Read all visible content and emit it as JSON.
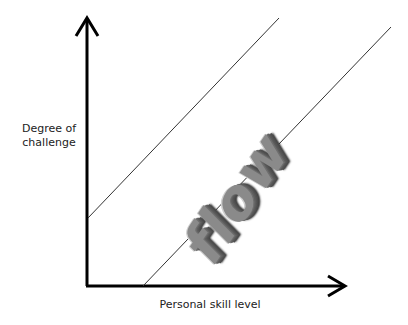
{
  "diagram": {
    "type": "flow-channel",
    "y_axis_label": "Degree of\nchallenge",
    "x_axis_label": "Personal skill level",
    "center_word": "flow",
    "colors": {
      "axis": "#000000",
      "boundary_line": "#333333",
      "word": "#8a8a8a",
      "background": "#ffffff"
    },
    "axes": {
      "origin": [
        87,
        286
      ],
      "y_axis_top": [
        87,
        18
      ],
      "x_axis_right": [
        345,
        286
      ]
    },
    "boundaries": [
      {
        "name": "upper-boundary",
        "from": [
          88,
          218
        ],
        "to": [
          279,
          18
        ]
      },
      {
        "name": "lower-boundary",
        "from": [
          143,
          286
        ],
        "to": [
          391,
          27
        ]
      }
    ]
  }
}
